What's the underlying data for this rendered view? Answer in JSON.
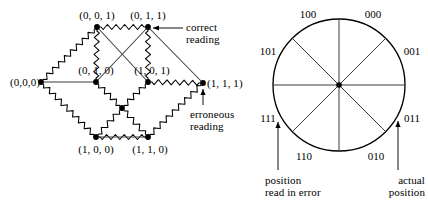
{
  "figure": {
    "background": "#ffffff",
    "ink": "#000000"
  },
  "cube_diagram": {
    "name": "3-bit-code-cube",
    "vertices": [
      {
        "id": "v001",
        "label": "(0, 0, 1)",
        "x": 97,
        "y": 27,
        "label_x": 97,
        "label_y": 9,
        "anchor": "ctr"
      },
      {
        "id": "v011",
        "label": "(0, 1, 1)",
        "x": 148,
        "y": 27,
        "label_x": 148,
        "label_y": 9,
        "anchor": "ctr"
      },
      {
        "id": "v000",
        "label": "(0,0,0)",
        "x": 41,
        "y": 82,
        "label_x": 40,
        "label_y": 76,
        "anchor": "rgt"
      },
      {
        "id": "v010",
        "label": "(0, 1, 0)",
        "x": 96,
        "y": 82,
        "label_x": 96,
        "label_y": 64,
        "anchor": "ctr"
      },
      {
        "id": "v101",
        "label": "(1, 0, 1)",
        "x": 148,
        "y": 82,
        "label_x": 152,
        "label_y": 64,
        "anchor": "ctr"
      },
      {
        "id": "v111",
        "label": "(1, 1, 1)",
        "x": 203,
        "y": 83,
        "label_x": 207,
        "label_y": 77,
        "anchor": "left"
      },
      {
        "id": "v100",
        "label": "(1, 0, 0)",
        "x": 96,
        "y": 137,
        "label_x": 96,
        "label_y": 143,
        "anchor": "ctr"
      },
      {
        "id": "v110",
        "label": "(1, 1, 0)",
        "x": 148,
        "y": 137,
        "label_x": 150,
        "label_y": 143,
        "anchor": "ctr"
      },
      {
        "id": "vhidden",
        "label": "",
        "x": 122,
        "y": 108,
        "label_x": 122,
        "label_y": 108,
        "anchor": "ctr"
      }
    ],
    "spring_edges": [
      {
        "from": "v000",
        "to": "v001"
      },
      {
        "from": "v001",
        "to": "v011"
      },
      {
        "from": "v011",
        "to": "v101"
      },
      {
        "from": "v010",
        "to": "v001"
      },
      {
        "from": "v010",
        "to": "vhidden"
      },
      {
        "from": "v101",
        "to": "v111"
      },
      {
        "from": "v111",
        "to": "v110"
      },
      {
        "from": "v110",
        "to": "vhidden"
      },
      {
        "from": "v100",
        "to": "vhidden"
      },
      {
        "from": "v000",
        "to": "v100"
      },
      {
        "from": "v100",
        "to": "v110"
      },
      {
        "from": "vhidden",
        "to": "v101"
      }
    ],
    "straight_edges": [
      {
        "from": "v000",
        "to": "v010"
      },
      {
        "from": "v100",
        "to": "v110"
      },
      {
        "from": "v011",
        "to": "v111"
      },
      {
        "from": "v001",
        "to": "v101"
      },
      {
        "from": "v010",
        "to": "v011"
      }
    ],
    "annotations": [
      {
        "id": "correct-reading",
        "line1": "correct",
        "line2": "reading",
        "text_x": 186,
        "text_y": 21,
        "arrow_from_x": 183,
        "arrow_from_y": 28,
        "arrow_to_x": 153,
        "arrow_to_y": 28
      },
      {
        "id": "erroneous-reading",
        "line1": "erroneous",
        "line2": "reading",
        "text_x": 190,
        "text_y": 108,
        "arrow_from_x": 203,
        "arrow_from_y": 105,
        "arrow_to_x": 203,
        "arrow_to_y": 89
      }
    ]
  },
  "disc_diagram": {
    "name": "rotary-encoder-disc",
    "center_x": 339,
    "center_y": 85,
    "radius": 66,
    "sector_count": 8,
    "sector_labels": [
      {
        "code": "000",
        "x": 373,
        "y": 14
      },
      {
        "code": "001",
        "x": 412,
        "y": 51
      },
      {
        "code": "011",
        "x": 412,
        "y": 118
      },
      {
        "code": "010",
        "x": 376,
        "y": 156
      },
      {
        "code": "110",
        "x": 304,
        "y": 156
      },
      {
        "code": "111",
        "x": 268,
        "y": 118
      },
      {
        "code": "101",
        "x": 268,
        "y": 51
      },
      {
        "code": "100",
        "x": 308,
        "y": 14
      }
    ],
    "annotations": [
      {
        "id": "position-read-in-error",
        "line1": "position",
        "line2": "read in error",
        "text_x": 265,
        "text_y": 174,
        "anchor": "left",
        "arrow_from_x": 278,
        "arrow_from_y": 170,
        "arrow_to_x": 278,
        "arrow_to_y": 122
      },
      {
        "id": "actual-position",
        "line1": "actual",
        "line2": "position",
        "text_x": 425,
        "text_y": 174,
        "anchor": "rgt",
        "arrow_from_x": 398,
        "arrow_from_y": 170,
        "arrow_to_x": 398,
        "arrow_to_y": 121
      }
    ]
  }
}
